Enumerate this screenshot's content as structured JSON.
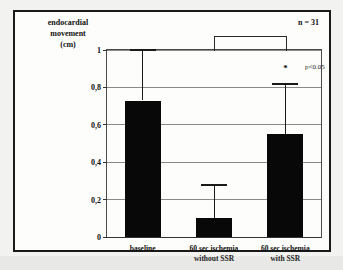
{
  "figure": {
    "axis_title_lines": [
      "endocardial",
      "movement",
      "(cm)"
    ],
    "n_label": "n = 31",
    "p_label": "p<0.05",
    "significance_star": "*"
  },
  "chart_data": {
    "type": "bar",
    "title": "",
    "xlabel": "",
    "ylabel": "endocardial movement (cm)",
    "categories": [
      "baseline",
      "60 sec ischemia without SSR",
      "60 sec ischemia with SSR"
    ],
    "category_label_lines": [
      [
        "baseline"
      ],
      [
        "60 sec ischemia",
        "without SSR"
      ],
      [
        "60 sec ischemia",
        "with SSR"
      ]
    ],
    "values": [
      0.73,
      0.1,
      0.55
    ],
    "errors_upper": [
      1.0,
      0.28,
      0.82
    ],
    "ylim": [
      0,
      1
    ],
    "yticks": [
      0,
      0.2,
      0.4,
      0.6,
      0.8,
      1
    ],
    "ytick_labels": [
      "0",
      "0,2",
      "0,4",
      "0,6",
      "0,8",
      "1"
    ],
    "grid": true,
    "legend": "none",
    "annotations": [
      {
        "text": "n = 31",
        "position": "top-right"
      },
      {
        "text": "p<0.05",
        "position": "right-of-bracket"
      },
      {
        "text": "*",
        "position": "above-bar-3"
      }
    ],
    "significance_bracket": {
      "from": 1,
      "to": 2,
      "y": 1.0
    },
    "bar_color": "#080808"
  }
}
